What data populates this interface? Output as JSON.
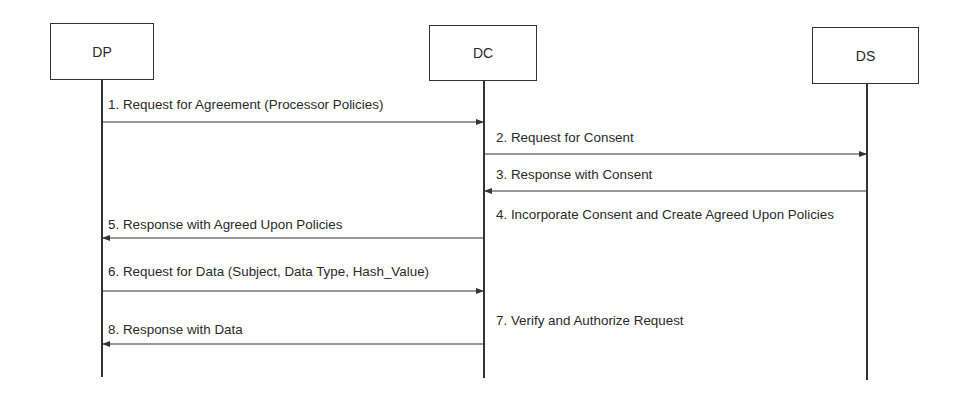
{
  "diagram": {
    "type": "sequence",
    "colors": {
      "line": "#333333",
      "text": "#2a2a2a",
      "background": "#ffffff"
    },
    "actors": [
      {
        "id": "DP",
        "label": "DP",
        "x": 50,
        "y": 23,
        "w": 104,
        "h": 57,
        "lifeline_x": 102,
        "lifeline_end": 377
      },
      {
        "id": "DC",
        "label": "DC",
        "x": 429,
        "y": 25,
        "w": 108,
        "h": 56,
        "lifeline_x": 484,
        "lifeline_end": 378
      },
      {
        "id": "DS",
        "label": "DS",
        "x": 812,
        "y": 27,
        "w": 107,
        "h": 57,
        "lifeline_x": 867,
        "lifeline_end": 380
      }
    ],
    "messages": [
      {
        "num": 1,
        "label": "1. Request for Agreement (Processor Policies)",
        "from": "DP",
        "to": "DC",
        "arrow_y": 122,
        "label_x": 108,
        "label_y": 97
      },
      {
        "num": 2,
        "label": "2. Request for Consent",
        "from": "DC",
        "to": "DS",
        "arrow_y": 154,
        "label_x": 496,
        "label_y": 130
      },
      {
        "num": 3,
        "label": "3. Response with Consent",
        "from": "DS",
        "to": "DC",
        "arrow_y": 191,
        "label_x": 496,
        "label_y": 167
      },
      {
        "num": 4,
        "label": "4. Incorporate Consent and Create Agreed Upon Policies",
        "from": "DC",
        "to": "DC",
        "arrow_y": null,
        "label_x": 496,
        "label_y": 207
      },
      {
        "num": 5,
        "label": "5. Response with Agreed Upon Policies",
        "from": "DC",
        "to": "DP",
        "arrow_y": 238,
        "label_x": 108,
        "label_y": 217
      },
      {
        "num": 6,
        "label": "6. Request for Data (Subject, Data Type, Hash_Value)",
        "from": "DP",
        "to": "DC",
        "arrow_y": 291,
        "label_x": 108,
        "label_y": 264
      },
      {
        "num": 7,
        "label": "7. Verify and Authorize Request",
        "from": "DC",
        "to": "DC",
        "arrow_y": null,
        "label_x": 496,
        "label_y": 313
      },
      {
        "num": 8,
        "label": "8. Response with Data",
        "from": "DC",
        "to": "DP",
        "arrow_y": 344,
        "label_x": 108,
        "label_y": 322
      }
    ]
  }
}
